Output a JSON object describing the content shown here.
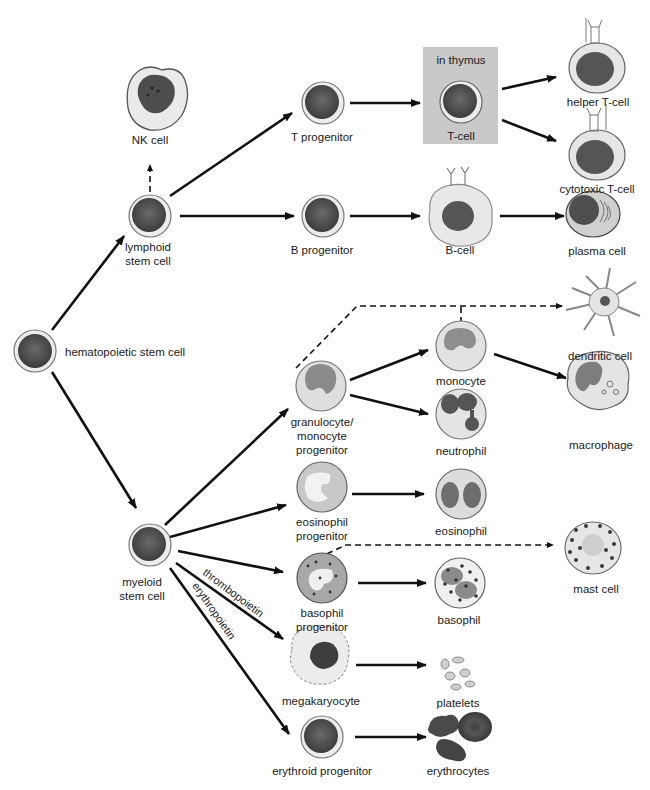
{
  "diagram": {
    "colors": {
      "arrow": "#111111",
      "nucleus_dark": "#4a4a4a",
      "cytoplasm": "#e8e8e8",
      "thymus_box": "#c9c9c9",
      "erythrocyte": "#555555"
    },
    "nodes": {
      "hsc": {
        "label": "hematopoietic stem cell"
      },
      "lymphoid": {
        "label_line1": "lymphoid",
        "label_line2": "stem cell"
      },
      "nk": {
        "label": "NK cell"
      },
      "t_prog": {
        "label": "T progenitor"
      },
      "thymus": {
        "box_label": "in thymus",
        "label": "T-cell"
      },
      "helper_t": {
        "label": "helper T-cell"
      },
      "cytotoxic_t": {
        "label": "cytotoxic T-cell"
      },
      "b_prog": {
        "label": "B progenitor"
      },
      "b_cell": {
        "label": "B-cell"
      },
      "plasma": {
        "label": "plasma cell"
      },
      "myeloid": {
        "label_line1": "myeloid",
        "label_line2": "stem cell"
      },
      "gm_prog": {
        "label_line1": "granulocyte/",
        "label_line2": "monocyte",
        "label_line3": "progenitor"
      },
      "monocyte": {
        "label": "monocyte"
      },
      "neutrophil": {
        "label": "neutrophil"
      },
      "dendritic": {
        "label": "dendritic cell"
      },
      "macrophage": {
        "label": "macrophage"
      },
      "eos_prog": {
        "label_line1": "eosinophil",
        "label_line2": "progenitor"
      },
      "eosinophil": {
        "label": "eosinophil"
      },
      "baso_prog": {
        "label_line1": "basophil",
        "label_line2": "progenitor"
      },
      "basophil": {
        "label": "basophil"
      },
      "mast": {
        "label": "mast cell"
      },
      "megakaryocyte": {
        "label": "megakaryocyte"
      },
      "platelets": {
        "label": "platelets"
      },
      "erythroid_prog": {
        "label": "erythroid progenitor"
      },
      "erythrocytes": {
        "label": "erythrocytes"
      }
    },
    "edge_labels": {
      "thrombopoietin": "thrombopoietin",
      "erythropoietin": "erythropoietin"
    },
    "edges": [
      {
        "from": "hsc",
        "to": "lymphoid",
        "style": "solid"
      },
      {
        "from": "hsc",
        "to": "myeloid",
        "style": "solid"
      },
      {
        "from": "lymphoid",
        "to": "nk",
        "style": "dashed"
      },
      {
        "from": "lymphoid",
        "to": "t_prog",
        "style": "solid"
      },
      {
        "from": "lymphoid",
        "to": "b_prog",
        "style": "solid"
      },
      {
        "from": "t_prog",
        "to": "thymus",
        "style": "solid"
      },
      {
        "from": "thymus",
        "to": "helper_t",
        "style": "solid"
      },
      {
        "from": "thymus",
        "to": "cytotoxic_t",
        "style": "solid"
      },
      {
        "from": "b_prog",
        "to": "b_cell",
        "style": "solid"
      },
      {
        "from": "b_cell",
        "to": "plasma",
        "style": "solid"
      },
      {
        "from": "myeloid",
        "to": "gm_prog",
        "style": "solid"
      },
      {
        "from": "myeloid",
        "to": "eos_prog",
        "style": "solid"
      },
      {
        "from": "myeloid",
        "to": "baso_prog",
        "style": "solid"
      },
      {
        "from": "myeloid",
        "to": "megakaryocyte",
        "style": "solid",
        "label": "thrombopoietin"
      },
      {
        "from": "myeloid",
        "to": "erythroid_prog",
        "style": "solid",
        "label": "erythropoietin"
      },
      {
        "from": "gm_prog",
        "to": "monocyte",
        "style": "solid"
      },
      {
        "from": "gm_prog",
        "to": "neutrophil",
        "style": "solid"
      },
      {
        "from": "gm_prog",
        "to": "dendritic",
        "style": "dashed"
      },
      {
        "from": "monocyte",
        "to": "dendritic",
        "style": "dashed"
      },
      {
        "from": "monocyte",
        "to": "macrophage",
        "style": "solid"
      },
      {
        "from": "eos_prog",
        "to": "eosinophil",
        "style": "solid"
      },
      {
        "from": "baso_prog",
        "to": "basophil",
        "style": "solid"
      },
      {
        "from": "baso_prog",
        "to": "mast",
        "style": "dashed"
      },
      {
        "from": "megakaryocyte",
        "to": "platelets",
        "style": "solid"
      },
      {
        "from": "erythroid_prog",
        "to": "erythrocytes",
        "style": "solid"
      }
    ]
  }
}
